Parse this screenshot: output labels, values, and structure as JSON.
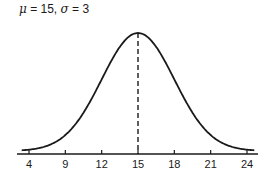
{
  "chart_data": {
    "type": "line",
    "title": "μ = 15,  σ = 3",
    "subtitle": "",
    "xlabel": "",
    "ylabel": "",
    "mu": 15,
    "sigma": 3,
    "x_ticks": [
      "4",
      "9",
      "12",
      "15",
      "18",
      "21",
      "24"
    ],
    "x_tick_positions": [
      6,
      9,
      12,
      15,
      18,
      21,
      24
    ],
    "xlim": [
      5.3,
      25.0
    ],
    "grid": false,
    "legend": "none",
    "annotations": [
      {
        "type": "dashed-vertical-line",
        "x": 15,
        "label": "mean"
      }
    ],
    "series": [
      {
        "name": "normal density",
        "x": [
          6,
          9,
          12,
          15,
          18,
          21,
          24
        ],
        "values": [
          0.0015,
          0.018,
          0.0807,
          0.133,
          0.0807,
          0.018,
          0.0015
        ]
      }
    ]
  },
  "title": {
    "mu_symbol": "μ",
    "mu_text": " = 15,  ",
    "sigma_symbol": "σ",
    "sigma_text": " = 3"
  }
}
